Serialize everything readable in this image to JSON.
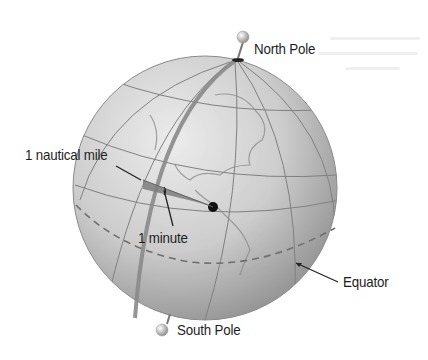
{
  "diagram": {
    "labels": {
      "north_pole": "North Pole",
      "south_pole": "South Pole",
      "nautical_mile": "1 nautical mile",
      "minute": "1 minute",
      "equator": "Equator"
    },
    "colors": {
      "background": "#ffffff",
      "globe_light": "#e6e6e6",
      "globe_dark": "#9a9a9a",
      "grid_line": "#7a7a7a",
      "meridian_highlight": "#8a8a8a",
      "equator_dash": "#777777",
      "label_text": "#1e1e1e",
      "pin_head": "#bdbdbd"
    },
    "globe": {
      "center_x": 205,
      "center_y": 188,
      "radius": 132
    }
  }
}
